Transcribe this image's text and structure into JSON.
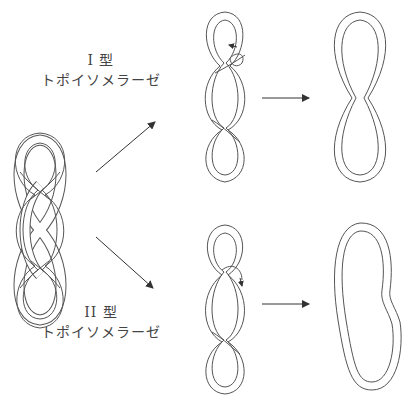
{
  "labels": {
    "type1_title": "I 型",
    "type1_name": "トポイソメラーゼ",
    "type2_title": "II 型",
    "type2_name": "トポイソメラーゼ"
  },
  "colors": {
    "stroke": "#555555",
    "arrow": "#333333",
    "background": "#ffffff"
  },
  "panels": [
    {
      "id": "start",
      "description": "Supercoiled DNA loop (2 crossings, 3 lobes)"
    },
    {
      "id": "type1-intermediate",
      "description": "Single strand passing, arrow shows rotation"
    },
    {
      "id": "type1-result",
      "description": "Figure-eight, one crossing removed"
    },
    {
      "id": "type2-intermediate",
      "description": "Double strand passing through"
    },
    {
      "id": "type2-result",
      "description": "Relaxed loop, two crossings removed"
    }
  ]
}
